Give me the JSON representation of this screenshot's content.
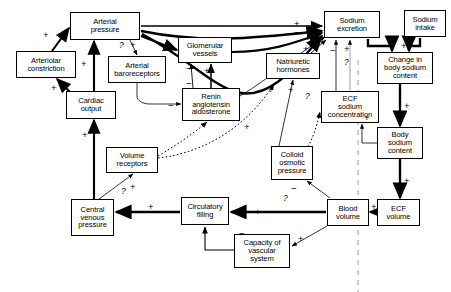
{
  "diagram": {
    "type": "causal-loop-diagram",
    "nodes": [
      {
        "id": "arterial-pressure",
        "label": "Arterial\npressure",
        "x": 70,
        "y": 12,
        "w": 70,
        "h": 28
      },
      {
        "id": "arteriolar-constriction",
        "label": "Arteriolar\nconstriction",
        "x": 16,
        "y": 51,
        "w": 60,
        "h": 27
      },
      {
        "id": "cardiac-output",
        "label": "Cardiac\noutput",
        "x": 66,
        "y": 91,
        "w": 50,
        "h": 28
      },
      {
        "id": "arterial-baroreceptors",
        "label": "Arterial\nbaroreceptors",
        "x": 108,
        "y": 56,
        "w": 58,
        "h": 27
      },
      {
        "id": "glomerular-vessels",
        "label": "Glomerular\nvessels",
        "x": 178,
        "y": 37,
        "w": 54,
        "h": 26
      },
      {
        "id": "renin-angiotensin",
        "label": "Renin\nangiotensin\naldosterone",
        "x": 182,
        "y": 88,
        "w": 58,
        "h": 33
      },
      {
        "id": "natriuretic-hormones",
        "label": "Natriuretic\nhormones",
        "x": 266,
        "y": 53,
        "w": 54,
        "h": 26
      },
      {
        "id": "sodium-excretion",
        "label": "Sodium\nexcretion",
        "x": 324,
        "y": 11,
        "w": 56,
        "h": 27
      },
      {
        "id": "sodium-intake",
        "label": "Sodium\nintake",
        "x": 404,
        "y": 10,
        "w": 42,
        "h": 27
      },
      {
        "id": "change-body-sodium",
        "label": "Change in\nbody sodium\ncontent",
        "x": 377,
        "y": 52,
        "w": 56,
        "h": 32
      },
      {
        "id": "ecf-sodium-concentration",
        "label": "ECF\nsodium\nconcentration",
        "x": 321,
        "y": 91,
        "w": 58,
        "h": 32
      },
      {
        "id": "body-sodium-content",
        "label": "Body\nsodium\ncontent",
        "x": 377,
        "y": 127,
        "w": 46,
        "h": 32
      },
      {
        "id": "volume-receptors",
        "label": "Volume\nreceptors",
        "x": 106,
        "y": 147,
        "w": 52,
        "h": 26
      },
      {
        "id": "colloid-osmotic-pressure",
        "label": "Colloid\nosmotic\npressure",
        "x": 271,
        "y": 146,
        "w": 42,
        "h": 34
      },
      {
        "id": "central-venous-pressure",
        "label": "Central\nvenous\npressure",
        "x": 71,
        "y": 199,
        "w": 43,
        "h": 37
      },
      {
        "id": "circulatory-filling",
        "label": "Circulatory\nfilling",
        "x": 181,
        "y": 197,
        "w": 48,
        "h": 28
      },
      {
        "id": "blood-volume",
        "label": "Blood\nvolume",
        "x": 327,
        "y": 199,
        "w": 42,
        "h": 27
      },
      {
        "id": "ecf-volume",
        "label": "ECF\nvolume",
        "x": 377,
        "y": 199,
        "w": 43,
        "h": 27
      },
      {
        "id": "capacity-vascular-system",
        "label": "Capacity of\nvascular\nsystem",
        "x": 234,
        "y": 234,
        "w": 56,
        "h": 34
      }
    ],
    "signs": [
      {
        "id": "s1",
        "text": "+",
        "x": 43,
        "y": 30
      },
      {
        "id": "s2",
        "text": "+",
        "x": 81,
        "y": 59
      },
      {
        "id": "s3",
        "text": "+",
        "x": 51,
        "y": 83
      },
      {
        "id": "s4",
        "text": "+",
        "x": 82,
        "y": 130
      },
      {
        "id": "s5",
        "text": "?",
        "x": 119,
        "y": 41
      },
      {
        "id": "s6",
        "text": "+",
        "x": 130,
        "y": 40
      },
      {
        "id": "s7",
        "text": "+",
        "x": 165,
        "y": 43
      },
      {
        "id": "s8",
        "text": "−",
        "x": 186,
        "y": 64
      },
      {
        "id": "s9",
        "text": "+",
        "x": 204,
        "y": 66
      },
      {
        "id": "s10",
        "text": "−",
        "x": 186,
        "y": 79
      },
      {
        "id": "s11",
        "text": "−",
        "x": 168,
        "y": 101
      },
      {
        "id": "s12",
        "text": "+",
        "x": 244,
        "y": 122
      },
      {
        "id": "s13",
        "text": "+",
        "x": 294,
        "y": 19
      },
      {
        "id": "s14",
        "text": "−",
        "x": 294,
        "y": 28
      },
      {
        "id": "s15",
        "text": "−",
        "x": 294,
        "y": 37
      },
      {
        "id": "s16",
        "text": "+",
        "x": 303,
        "y": 44
      },
      {
        "id": "s17",
        "text": "+",
        "x": 268,
        "y": 85
      },
      {
        "id": "s18",
        "text": "+",
        "x": 288,
        "y": 85
      },
      {
        "id": "s19",
        "text": "?",
        "x": 305,
        "y": 92
      },
      {
        "id": "s20",
        "text": "−",
        "x": 330,
        "y": 46
      },
      {
        "id": "s21",
        "text": "+",
        "x": 344,
        "y": 44
      },
      {
        "id": "s22",
        "text": "?",
        "x": 344,
        "y": 58
      },
      {
        "id": "s23",
        "text": "−",
        "x": 385,
        "y": 41
      },
      {
        "id": "s24",
        "text": "+",
        "x": 401,
        "y": 41
      },
      {
        "id": "s25",
        "text": "+",
        "x": 404,
        "y": 101
      },
      {
        "id": "s26",
        "text": "+",
        "x": 404,
        "y": 176
      },
      {
        "id": "s27",
        "text": "+",
        "x": 364,
        "y": 113
      },
      {
        "id": "s28",
        "text": "?",
        "x": 121,
        "y": 187
      },
      {
        "id": "s29",
        "text": "+",
        "x": 130,
        "y": 182
      },
      {
        "id": "s30",
        "text": "+",
        "x": 148,
        "y": 202
      },
      {
        "id": "s31",
        "text": "−",
        "x": 239,
        "y": 229
      },
      {
        "id": "s32",
        "text": "+",
        "x": 255,
        "y": 207
      },
      {
        "id": "s33",
        "text": "+",
        "x": 298,
        "y": 234
      },
      {
        "id": "s34",
        "text": "−",
        "x": 291,
        "y": 184
      },
      {
        "id": "s35",
        "text": "?",
        "x": 283,
        "y": 194
      },
      {
        "id": "s36",
        "text": "+",
        "x": 371,
        "y": 202
      }
    ]
  }
}
